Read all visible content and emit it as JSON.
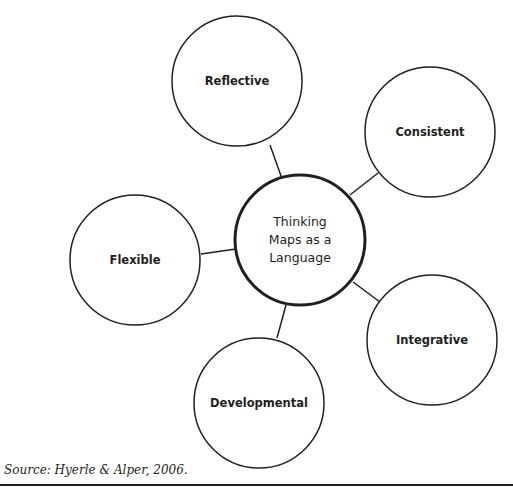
{
  "diagram": {
    "center": {
      "label": "Thinking\nMaps as a\nLanguage",
      "cx": 300,
      "cy": 240,
      "r": 65
    },
    "nodes": [
      {
        "label": "Reflective",
        "cx": 237,
        "cy": 81,
        "r": 65,
        "line": [
          270,
          145,
          281,
          176
        ]
      },
      {
        "label": "Consistent",
        "cx": 430,
        "cy": 132,
        "r": 65,
        "line": [
          350,
          195,
          378,
          173
        ]
      },
      {
        "label": "Flexible",
        "cx": 135,
        "cy": 260,
        "r": 65,
        "line": [
          201,
          254,
          236,
          249
        ]
      },
      {
        "label": "Integrative",
        "cx": 432,
        "cy": 340,
        "r": 65,
        "line": [
          353,
          282,
          380,
          302
        ]
      },
      {
        "label": "Developmental",
        "cx": 259,
        "cy": 403,
        "r": 65,
        "line": [
          286,
          305,
          277,
          338
        ]
      }
    ]
  },
  "source": "Source: Hyerle & Alper, 2006.",
  "colors": {
    "stroke": "#231f20",
    "background": "#ffffff"
  }
}
